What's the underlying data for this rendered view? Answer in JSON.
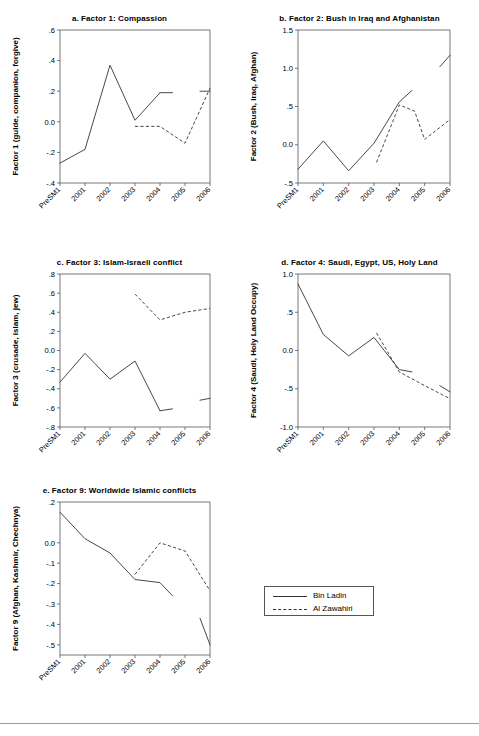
{
  "figure": {
    "x_categories": [
      "PreSM1",
      "2001",
      "2002",
      "2003",
      "2004",
      "2005",
      "2006"
    ],
    "legend": {
      "bin_ladin": "Bin Ladin",
      "al_zawahiri": "Al Zawahiri"
    }
  },
  "chart_data": [
    {
      "id": "a",
      "type": "line",
      "title": "a. Factor 1: Compassion",
      "xlabel": "",
      "ylabel": "Factor 1 (guide, companion, forgive)",
      "x": [
        "PreSM1",
        "2001",
        "2002",
        "2003",
        "2004",
        "2005",
        "2006"
      ],
      "ylim": [
        -0.4,
        0.6
      ],
      "yticks": [
        -0.4,
        -0.2,
        0.0,
        0.2,
        0.4,
        0.6
      ],
      "ytick_labels": [
        "-.4",
        "-.2",
        "0.0",
        ".2",
        ".4",
        ".6"
      ],
      "grid": false,
      "series": [
        {
          "name": "Bin Ladin",
          "style": "solid",
          "segments": [
            {
              "x": [
                "PreSM1",
                "2001",
                "2002",
                "2003",
                "2004"
              ],
              "values": [
                -0.27,
                -0.18,
                0.37,
                0.01,
                0.19
              ]
            },
            {
              "x": [
                "2004",
                "2004.5"
              ],
              "values": [
                0.19,
                0.19
              ]
            },
            {
              "x": [
                "2005.6",
                "2006"
              ],
              "values": [
                0.2,
                0.2
              ]
            }
          ]
        },
        {
          "name": "Al Zawahiri",
          "style": "dashed",
          "segments": [
            {
              "x": [
                "2003",
                "2004",
                "2005",
                "2006"
              ],
              "values": [
                -0.03,
                -0.03,
                -0.14,
                0.22
              ]
            }
          ]
        }
      ]
    },
    {
      "id": "b",
      "type": "line",
      "title": "b. Factor 2: Bush in Iraq and Afghanistan",
      "xlabel": "",
      "ylabel": "Factor 2 (Bush, Iraq, Afghan)",
      "x": [
        "PreSM1",
        "2001",
        "2002",
        "2003",
        "2004",
        "2005",
        "2006"
      ],
      "ylim": [
        -0.5,
        1.5
      ],
      "yticks": [
        -0.5,
        0.0,
        0.5,
        1.0,
        1.5
      ],
      "ytick_labels": [
        "-.5",
        "0.0",
        ".5",
        "1.0",
        "1.5"
      ],
      "grid": false,
      "series": [
        {
          "name": "Bin Ladin",
          "style": "solid",
          "segments": [
            {
              "x": [
                "PreSM1",
                "2001",
                "2002",
                "2003",
                "2004",
                "2004.5"
              ],
              "values": [
                -0.32,
                0.05,
                -0.34,
                0.02,
                0.56,
                0.71
              ]
            },
            {
              "x": [
                "2005.6",
                "2006"
              ],
              "values": [
                1.02,
                1.17
              ]
            }
          ]
        },
        {
          "name": "Al Zawahiri",
          "style": "dashed",
          "segments": [
            {
              "x": [
                "2003.1",
                "2004",
                "2004.6",
                "2005",
                "2006"
              ],
              "values": [
                -0.23,
                0.52,
                0.44,
                0.07,
                0.33
              ]
            }
          ]
        }
      ]
    },
    {
      "id": "c",
      "type": "line",
      "title": "c. Factor 3: Islam-Israeli conflict",
      "xlabel": "",
      "ylabel": "Factor 3 (crusade, islam, jew)",
      "x": [
        "PreSM1",
        "2001",
        "2002",
        "2003",
        "2004",
        "2005",
        "2006"
      ],
      "ylim": [
        -0.8,
        0.8
      ],
      "yticks": [
        -0.8,
        -0.6,
        -0.4,
        -0.2,
        0.0,
        0.2,
        0.4,
        0.6,
        0.8
      ],
      "ytick_labels": [
        "-.8",
        "-.6",
        "-.4",
        "-.2",
        "0.0",
        ".2",
        ".4",
        ".6",
        ".8"
      ],
      "grid": false,
      "series": [
        {
          "name": "Bin Ladin",
          "style": "solid",
          "segments": [
            {
              "x": [
                "PreSM1",
                "2001",
                "2002",
                "2003",
                "2004"
              ],
              "values": [
                -0.33,
                -0.03,
                -0.3,
                -0.11,
                -0.63
              ]
            },
            {
              "x": [
                "2004",
                "2004.5"
              ],
              "values": [
                -0.63,
                -0.61
              ]
            },
            {
              "x": [
                "2005.6",
                "2006"
              ],
              "values": [
                -0.52,
                -0.5
              ]
            }
          ]
        },
        {
          "name": "Al Zawahiri",
          "style": "dashed",
          "segments": [
            {
              "x": [
                "2003",
                "2004",
                "2005",
                "2006"
              ],
              "values": [
                0.59,
                0.32,
                0.4,
                0.44
              ]
            }
          ]
        }
      ]
    },
    {
      "id": "d",
      "type": "line",
      "title": "d. Factor 4: Saudi, Egypt, US, Holy Land",
      "xlabel": "",
      "ylabel": "Factor 4 (Saudi, Holy Land Occupy)",
      "x": [
        "PreSM1",
        "2001",
        "2002",
        "2003",
        "2004",
        "2005",
        "2006"
      ],
      "ylim": [
        -1.0,
        1.0
      ],
      "yticks": [
        -1.0,
        -0.5,
        0.0,
        0.5,
        1.0
      ],
      "ytick_labels": [
        "-1.0",
        "-.5",
        "0.0",
        ".5",
        "1.0"
      ],
      "grid": false,
      "series": [
        {
          "name": "Bin Ladin",
          "style": "solid",
          "segments": [
            {
              "x": [
                "PreSM1",
                "2001",
                "2002",
                "2003",
                "2004",
                "2004.5"
              ],
              "values": [
                0.87,
                0.21,
                -0.07,
                0.17,
                -0.25,
                -0.28
              ]
            },
            {
              "x": [
                "2005.6",
                "2006"
              ],
              "values": [
                -0.46,
                -0.54
              ]
            }
          ]
        },
        {
          "name": "Al Zawahiri",
          "style": "dashed",
          "segments": [
            {
              "x": [
                "2003.1",
                "2004",
                "2005",
                "2006"
              ],
              "values": [
                0.23,
                -0.28,
                -0.46,
                -0.63
              ]
            }
          ]
        }
      ]
    },
    {
      "id": "e",
      "type": "line",
      "title": "e. Factor 9: Worldwide Islamic conflicts",
      "xlabel": "",
      "ylabel": "Factor 9 (Afghan, Kashmir, Chechnya)",
      "x": [
        "PreSM1",
        "2001",
        "2002",
        "2003",
        "2004",
        "2005",
        "2006"
      ],
      "ylim": [
        -0.55,
        0.2
      ],
      "yticks": [
        0.2,
        0.0,
        -0.1,
        -0.2,
        -0.3,
        -0.4,
        -0.5
      ],
      "ytick_labels": [
        ".2",
        "0.0",
        "-.1",
        "-.2",
        "-.3",
        "-.4",
        "-.5"
      ],
      "grid": false,
      "series": [
        {
          "name": "Bin Ladin",
          "style": "solid",
          "segments": [
            {
              "x": [
                "PreSM1",
                "2001",
                "2002",
                "2003",
                "2004",
                "2004.5"
              ],
              "values": [
                0.15,
                0.02,
                -0.05,
                -0.18,
                -0.195,
                -0.26
              ]
            },
            {
              "x": [
                "2005.6",
                "2006"
              ],
              "values": [
                -0.37,
                -0.5
              ]
            }
          ]
        },
        {
          "name": "Al Zawahiri",
          "style": "dashed",
          "segments": [
            {
              "x": [
                "2003",
                "2004",
                "2005",
                "2006"
              ],
              "values": [
                -0.155,
                0.0,
                -0.04,
                -0.235
              ]
            }
          ]
        }
      ]
    }
  ]
}
